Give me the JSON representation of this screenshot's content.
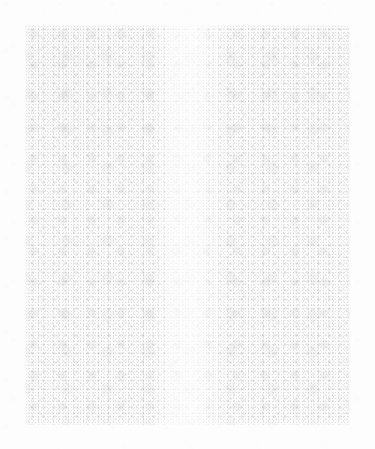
{
  "page": {
    "width": 375,
    "height": 449,
    "background_color": "#fdfdfd"
  },
  "texture_panel": {
    "x": 25,
    "y": 25,
    "width": 325,
    "height": 400,
    "fill_color": "#fbfbfb",
    "speckle_color": "#787880",
    "edge_style": "soft",
    "luminance_range": [
      225,
      250
    ]
  },
  "features": {
    "bright_vertical_band": {
      "x_start": 150,
      "x_end": 230,
      "note": "Lighter column through the horizontal centre of the panel"
    },
    "denser_speckle_regions": [
      "upper-left quadrant",
      "upper-right quadrant"
    ]
  },
  "content": {
    "text_elements": [],
    "icons": [],
    "controls": [],
    "note": "No text, icons, buttons or other interface elements are present in the image"
  }
}
